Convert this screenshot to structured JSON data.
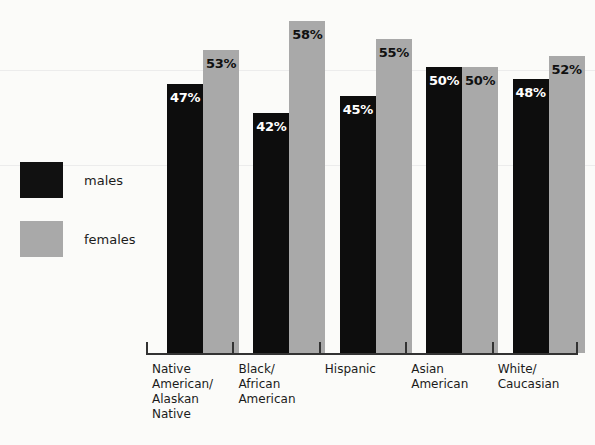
{
  "chart_data": {
    "type": "bar",
    "title": "",
    "subtitle": "",
    "xlabel": "",
    "ylabel": "",
    "grid": false,
    "legend_position": "left",
    "ylim": [
      0,
      60
    ],
    "categories": [
      "Native\nAmerican/\nAlaskan\nNative",
      "Black/\nAfrican\nAmerican",
      "Hispanic",
      "Asian\nAmerican",
      "White/\nCaucasian"
    ],
    "series": [
      {
        "name": "males",
        "color": "#0d0d0d",
        "values": [
          47,
          42,
          45,
          50,
          48
        ],
        "labels": [
          "47%",
          "42%",
          "45%",
          "50%",
          "48%"
        ]
      },
      {
        "name": "females",
        "color": "#a9a9a9",
        "values": [
          53,
          58,
          55,
          50,
          52
        ],
        "labels": [
          "53%",
          "58%",
          "55%",
          "50%",
          "52%"
        ]
      }
    ]
  },
  "legend": {
    "items": [
      {
        "label": "males",
        "color": "#0d0d0d"
      },
      {
        "label": "females",
        "color": "#a9a9a9"
      }
    ]
  }
}
